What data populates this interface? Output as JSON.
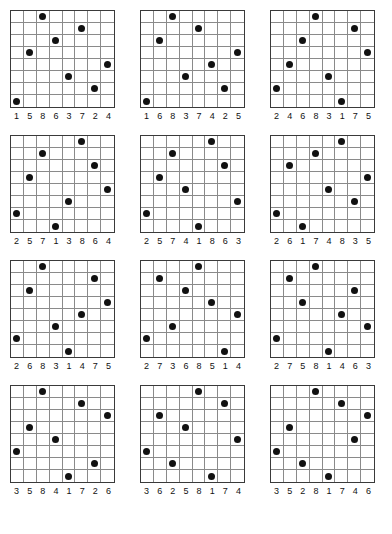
{
  "page": {
    "grid_size": 8,
    "columns_per_row": 3,
    "rows_of_puzzles": 4,
    "dot_color": "#111111",
    "border_color": "#3a3a3a",
    "gridline_color": "#8a8a8a",
    "background_color": "#ffffff"
  },
  "puzzles": [
    {
      "id": "puzzle-1",
      "dot_columns_by_row": [
        3,
        6,
        4,
        2,
        8,
        5,
        7,
        1
      ],
      "labels": [
        "1",
        "5",
        "8",
        "6",
        "3",
        "7",
        "2",
        "4"
      ]
    },
    {
      "id": "puzzle-2",
      "dot_columns_by_row": [
        3,
        5,
        2,
        8,
        6,
        4,
        7,
        1
      ],
      "labels": [
        "1",
        "6",
        "8",
        "3",
        "7",
        "4",
        "2",
        "5"
      ]
    },
    {
      "id": "puzzle-3",
      "dot_columns_by_row": [
        4,
        7,
        3,
        8,
        2,
        5,
        1,
        6
      ],
      "labels": [
        "2",
        "4",
        "6",
        "8",
        "3",
        "1",
        "7",
        "5"
      ]
    },
    {
      "id": "puzzle-4",
      "dot_columns_by_row": [
        6,
        3,
        7,
        2,
        8,
        5,
        1,
        4
      ],
      "labels": [
        "2",
        "5",
        "7",
        "1",
        "3",
        "8",
        "6",
        "4"
      ]
    },
    {
      "id": "puzzle-5",
      "dot_columns_by_row": [
        6,
        3,
        7,
        2,
        4,
        8,
        1,
        5
      ],
      "labels": [
        "2",
        "5",
        "7",
        "4",
        "1",
        "8",
        "6",
        "3"
      ]
    },
    {
      "id": "puzzle-6",
      "dot_columns_by_row": [
        6,
        4,
        2,
        8,
        5,
        7,
        1,
        3
      ],
      "labels": [
        "2",
        "6",
        "1",
        "7",
        "4",
        "8",
        "3",
        "5"
      ]
    },
    {
      "id": "puzzle-7",
      "dot_columns_by_row": [
        3,
        7,
        2,
        8,
        6,
        4,
        1,
        5
      ],
      "labels": [
        "2",
        "6",
        "8",
        "3",
        "1",
        "4",
        "7",
        "5"
      ]
    },
    {
      "id": "puzzle-8",
      "dot_columns_by_row": [
        5,
        2,
        4,
        6,
        8,
        3,
        1,
        7
      ],
      "labels": [
        "2",
        "7",
        "3",
        "6",
        "8",
        "5",
        "1",
        "4"
      ]
    },
    {
      "id": "puzzle-9",
      "dot_columns_by_row": [
        4,
        2,
        7,
        3,
        6,
        8,
        1,
        5
      ],
      "labels": [
        "2",
        "7",
        "5",
        "8",
        "1",
        "4",
        "6",
        "3"
      ]
    },
    {
      "id": "puzzle-10",
      "dot_columns_by_row": [
        3,
        6,
        8,
        2,
        4,
        1,
        7,
        5
      ],
      "labels": [
        "3",
        "5",
        "8",
        "4",
        "1",
        "7",
        "2",
        "6"
      ]
    },
    {
      "id": "puzzle-11",
      "dot_columns_by_row": [
        5,
        7,
        2,
        4,
        8,
        1,
        3,
        6
      ],
      "labels": [
        "3",
        "6",
        "2",
        "5",
        "8",
        "1",
        "7",
        "4"
      ]
    },
    {
      "id": "puzzle-12",
      "dot_columns_by_row": [
        4,
        6,
        8,
        2,
        7,
        1,
        3,
        5
      ],
      "labels": [
        "3",
        "5",
        "2",
        "8",
        "1",
        "7",
        "4",
        "6"
      ]
    }
  ]
}
